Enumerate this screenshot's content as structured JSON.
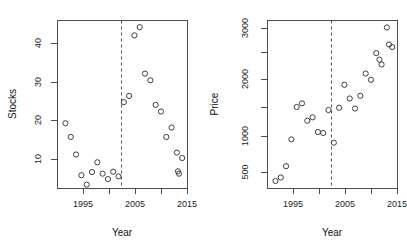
{
  "figure": {
    "title": "",
    "panel_count": 2,
    "background": "#ffffff",
    "point_color": "#3f3f3f",
    "axis_color": "#4d4d4d",
    "refline_color": "#555555"
  },
  "panels": {
    "stocks": {
      "ylabel": "Stocks",
      "xlabel": "Year",
      "xticks": [
        "1995",
        "",
        "2005",
        "",
        "2015"
      ],
      "yticks": [
        "10",
        "20",
        "30",
        "40"
      ]
    },
    "price": {
      "ylabel": "Price",
      "xlabel": "Year",
      "xticks": [
        "1995",
        "",
        "2005",
        "",
        "2015"
      ],
      "yticks": [
        "500",
        "1000",
        "",
        "2000",
        "",
        "3000"
      ]
    }
  },
  "chart_data": [
    {
      "type": "scatter",
      "title": "",
      "xlabel": "Year",
      "ylabel": "Stocks",
      "xlim": [
        1991.5,
        2016.0
      ],
      "ylim": [
        1.0,
        44.0
      ],
      "yscale": "linear",
      "grid": false,
      "legend": "none",
      "xticks": [
        1995,
        2000,
        2005,
        2010,
        2015
      ],
      "xtick_labels": [
        "1995",
        "",
        "2005",
        "",
        "2015"
      ],
      "yticks": [
        10,
        20,
        30,
        40
      ],
      "ytick_labels": [
        "10",
        "20",
        "30",
        "40"
      ],
      "marker": "open-circle",
      "annotations": [
        {
          "type": "vline",
          "x": 2002.3,
          "style": "dashed"
        }
      ],
      "x": [
        1993,
        1994,
        1995,
        1996,
        1997,
        1998,
        1999,
        2000,
        2001,
        2002,
        2003,
        2004,
        2005,
        2006,
        2007,
        2008,
        2009,
        2010,
        2011,
        2012,
        2013,
        2014,
        2015
      ],
      "values": [
        17.7,
        14.2,
        9.7,
        4.4,
        2.0,
        5.2,
        7.7,
        4.8,
        3.4,
        5.3,
        4.1,
        23.1,
        24.7,
        40.2,
        42.3,
        30.4,
        28.7,
        22.4,
        20.7,
        14.2,
        16.6,
        10.2,
        8.8
      ],
      "extra_points": [
        {
          "x": 2014.2,
          "y": 5.4
        },
        {
          "x": 2014.4,
          "y": 4.8
        }
      ]
    },
    {
      "type": "scatter",
      "title": "",
      "xlabel": "Year",
      "ylabel": "Price",
      "xlim": [
        1991.5,
        2016.0
      ],
      "ylim": [
        430,
        3150
      ],
      "yscale": "log",
      "grid": false,
      "legend": "none",
      "xticks": [
        1995,
        2000,
        2005,
        2010,
        2015
      ],
      "xtick_labels": [
        "1995",
        "",
        "2005",
        "",
        "2015"
      ],
      "yticks": [
        500,
        1000,
        1500,
        2000,
        2500,
        3000
      ],
      "ytick_labels": [
        "500",
        "1000",
        "",
        "2000",
        "",
        "3000"
      ],
      "marker": "open-circle",
      "annotations": [
        {
          "type": "vline",
          "x": 2002.3,
          "style": "dashed"
        }
      ],
      "x": [
        1993,
        1994,
        1995,
        1996,
        1997,
        1998,
        1999,
        2000,
        2001,
        2002,
        2003,
        2004,
        2005,
        2006,
        2007,
        2008,
        2009,
        2010,
        2011,
        2012,
        2013,
        2014,
        2015
      ],
      "values": [
        470,
        490,
        560,
        770,
        1130,
        1180,
        960,
        1000,
        840,
        830,
        1090,
        740,
        1120,
        1470,
        1250,
        1110,
        1290,
        1680,
        1560,
        2140,
        1870,
        2900,
        2300
      ],
      "extra_points": [
        {
          "x": 2012.6,
          "y": 1980
        },
        {
          "x": 2014.4,
          "y": 2370
        }
      ]
    }
  ]
}
